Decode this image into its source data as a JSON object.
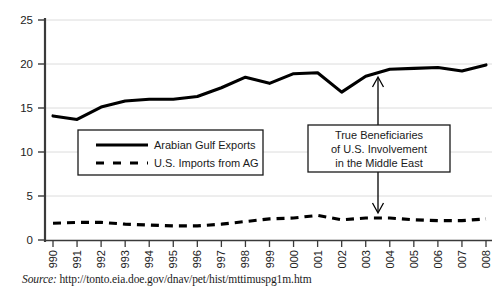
{
  "chart_data": {
    "type": "line",
    "title": "",
    "xlabel": "",
    "ylabel": "",
    "categories": [
      "1990",
      "1991",
      "1992",
      "1993",
      "1994",
      "1995",
      "1996",
      "1997",
      "1998",
      "1999",
      "2000",
      "2001",
      "2002",
      "2003",
      "2004",
      "2005",
      "2006",
      "2007",
      "2008"
    ],
    "ylim": [
      0,
      25
    ],
    "yticks": [
      0,
      5,
      10,
      15,
      20,
      25
    ],
    "grid": true,
    "legend_position": "center-left",
    "series": [
      {
        "name": "Arabian Gulf Exports",
        "style": "solid",
        "color": "#000000",
        "values": [
          14.1,
          13.7,
          15.1,
          15.8,
          16.0,
          16.0,
          16.3,
          17.3,
          18.5,
          17.8,
          18.9,
          19.0,
          16.8,
          18.6,
          19.4,
          19.5,
          19.6,
          19.2,
          19.9
        ]
      },
      {
        "name": "U.S. Imports from AG",
        "style": "dashed",
        "color": "#000000",
        "values": [
          1.9,
          2.0,
          2.0,
          1.8,
          1.7,
          1.6,
          1.6,
          1.8,
          2.1,
          2.4,
          2.5,
          2.8,
          2.3,
          2.5,
          2.5,
          2.3,
          2.2,
          2.2,
          2.4
        ]
      }
    ],
    "annotations": [
      {
        "id": "true-beneficiaries",
        "lines": [
          "True Beneficiaries",
          "of U.S. Involvement",
          "in the Middle East"
        ],
        "arrow_up_target_year": "2003",
        "arrow_down_target_year": "2003"
      }
    ]
  },
  "legend": {
    "items": [
      {
        "label": "Arabian Gulf Exports",
        "style": "solid"
      },
      {
        "label": "U.S. Imports from AG",
        "style": "dashed"
      }
    ]
  },
  "axis": {
    "y_labels": [
      "25",
      "20",
      "15",
      "10",
      "5",
      "0"
    ],
    "x_labels": [
      "1990",
      "1991",
      "1992",
      "1993",
      "1994",
      "1995",
      "1996",
      "1997",
      "1998",
      "1999",
      "2000",
      "2001",
      "2002",
      "2003",
      "2004",
      "2005",
      "2006",
      "2007",
      "2008"
    ]
  },
  "source": {
    "label": "Source:",
    "url": "http://tonto.eia.doe.gov/dnav/pet/hist/mttimuspg1m.htm"
  },
  "colors": {
    "line": "#000000",
    "grid": "#d9d9d9",
    "axis": "#3a3a3a",
    "text": "#1a1a1a",
    "background": "#ffffff"
  }
}
